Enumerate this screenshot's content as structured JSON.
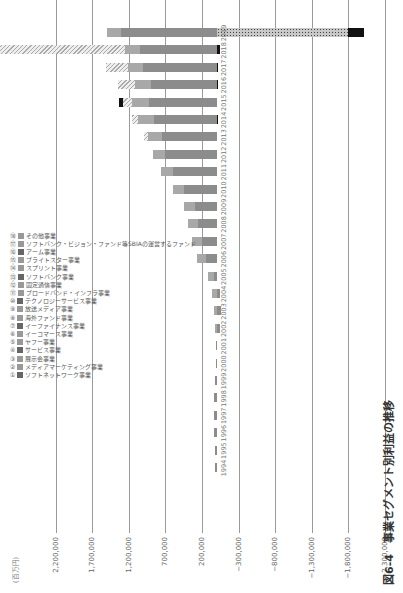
{
  "title": "図6-4　事業セグメント別利益の推移",
  "unit": "(百万円)",
  "colors": {
    "main": "#8c8c8c",
    "media": "#666",
    "hatch": "#bdbdbd",
    "vision": "#c8c8c8",
    "black": "#111",
    "light": "#d6d6d6"
  },
  "legend": [
    {
      "n": "①",
      "label": "ソフトネットワーク事業"
    },
    {
      "n": "②",
      "label": "メディアマーケティング事業"
    },
    {
      "n": "③",
      "label": "展示会事業"
    },
    {
      "n": "④",
      "label": "サービス事業"
    },
    {
      "n": "⑤",
      "label": "ヤフー事業"
    },
    {
      "n": "⑥",
      "label": "イーコマース事業"
    },
    {
      "n": "⑦",
      "label": "イーファイナンス事業"
    },
    {
      "n": "⑧",
      "label": "海外ファンド事業"
    },
    {
      "n": "⑨",
      "label": "放送メディア事業"
    },
    {
      "n": "⑩",
      "label": "テクノロジーサービス事業"
    },
    {
      "n": "⑪",
      "label": "ブロードバンド・インフラ事業"
    },
    {
      "n": "⑫",
      "label": "固定通信事業"
    },
    {
      "n": "⑬",
      "label": "ソフトバンク事業"
    },
    {
      "n": "⑭",
      "label": "スプリント事業"
    },
    {
      "n": "⑮",
      "label": "ブライトスター事業"
    },
    {
      "n": "⑯",
      "label": "アーム事業"
    },
    {
      "n": "⑰",
      "label": "ソフトバンク・ビジョン・ファンド等SBIAの運営するファンド"
    },
    {
      "n": "⑱",
      "label": "その他事業"
    }
  ],
  "chart_data": {
    "type": "bar",
    "orientation": "horizontal-stacked (page rotated 90° CCW)",
    "title": "図6-4　事業セグメント別利益の推移",
    "ylabel": "(百万円)",
    "ticks": [
      2200000,
      1700000,
      1200000,
      700000,
      200000,
      -300000,
      -800000,
      -1300000,
      -1800000,
      -2300000
    ],
    "categories": [
      "1994",
      "1995",
      "1996",
      "1997",
      "1998",
      "1999",
      "2000",
      "2001",
      "2002",
      "2003",
      "2004",
      "2005",
      "2006",
      "2007",
      "2008",
      "2009",
      "2010",
      "2011",
      "2012",
      "2013",
      "2014",
      "2015",
      "2016",
      "2017",
      "2018",
      "2019"
    ],
    "series": [
      {
        "name": "主要通信事業等",
        "values": [
          20000,
          25000,
          30000,
          35000,
          30000,
          20000,
          15000,
          10000,
          -40000,
          -60000,
          -50000,
          30000,
          150000,
          200000,
          250000,
          300000,
          450000,
          600000,
          700000,
          750000,
          850000,
          920000,
          900000,
          1000000,
          1050000,
          1300000
        ]
      },
      {
        "name": "ヤフー等",
        "values": [
          0,
          0,
          0,
          0,
          0,
          0,
          0,
          0,
          20000,
          40000,
          60000,
          90000,
          120000,
          130000,
          140000,
          150000,
          150000,
          160000,
          170000,
          190000,
          220000,
          240000,
          220000,
          210000,
          200000,
          200000
        ]
      },
      {
        "name": "アーム・ファンド等",
        "values": [
          0,
          0,
          0,
          0,
          0,
          0,
          0,
          0,
          0,
          0,
          0,
          0,
          0,
          0,
          0,
          0,
          0,
          0,
          0,
          50000,
          80000,
          120000,
          230000,
          300000,
          2350000,
          0
        ]
      },
      {
        "name": "ビジョン・ファンド(損失)",
        "values": [
          0,
          0,
          0,
          0,
          0,
          0,
          0,
          0,
          0,
          0,
          0,
          0,
          0,
          0,
          0,
          0,
          0,
          0,
          0,
          0,
          0,
          0,
          0,
          0,
          0,
          -1800000
        ]
      },
      {
        "name": "その他事業",
        "values": [
          0,
          0,
          0,
          0,
          0,
          0,
          0,
          0,
          0,
          0,
          0,
          0,
          0,
          0,
          0,
          0,
          0,
          0,
          0,
          0,
          -20000,
          60000,
          -15000,
          -15000,
          -50000,
          -220000
        ]
      }
    ],
    "ylim": [
      -2300000,
      2400000
    ]
  }
}
